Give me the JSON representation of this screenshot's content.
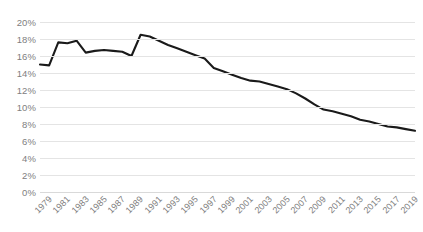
{
  "chart_data": {
    "type": "line",
    "title": "",
    "subtitle": "",
    "xlabel": "",
    "ylabel": "",
    "grid": true,
    "legend": false,
    "legend_position": "none",
    "line_color": "#1a1a1a",
    "gridline_color": "#e4e4e4",
    "axis_label_color": "#808080",
    "ylim": [
      0,
      20
    ],
    "y_ticks": [
      0,
      2,
      4,
      6,
      8,
      10,
      12,
      14,
      16,
      18,
      20
    ],
    "y_tick_labels": [
      "0%",
      "2%",
      "4%",
      "6%",
      "8%",
      "10%",
      "12%",
      "14%",
      "16%",
      "18%",
      "20%"
    ],
    "xlim": [
      1979,
      2020
    ],
    "x_tick_labels": [
      "1979",
      "1981",
      "1983",
      "1985",
      "1987",
      "1989",
      "1991",
      "1993",
      "1995",
      "1997",
      "1999",
      "2001",
      "2003",
      "2005",
      "2007",
      "2009",
      "2011",
      "2013",
      "2015",
      "2017",
      "2019"
    ],
    "x": [
      1979,
      1980,
      1981,
      1982,
      1983,
      1984,
      1985,
      1986,
      1987,
      1988,
      1989,
      1990,
      1991,
      1992,
      1993,
      1994,
      1995,
      1996,
      1997,
      1998,
      1999,
      2000,
      2001,
      2002,
      2003,
      2004,
      2005,
      2006,
      2007,
      2008,
      2009,
      2010,
      2011,
      2012,
      2013,
      2014,
      2015,
      2016,
      2017,
      2018,
      2019,
      2020
    ],
    "values": [
      15.0,
      14.9,
      17.6,
      17.5,
      17.8,
      16.4,
      16.6,
      16.7,
      16.6,
      16.5,
      16.0,
      18.5,
      18.3,
      17.8,
      17.3,
      16.9,
      16.5,
      16.1,
      15.7,
      14.6,
      14.2,
      13.8,
      13.4,
      13.1,
      13.0,
      12.7,
      12.4,
      12.1,
      11.6,
      11.0,
      10.3,
      9.7,
      9.5,
      9.2,
      8.9,
      8.5,
      8.3,
      8.0,
      7.7,
      7.6,
      7.4,
      7.2
    ]
  }
}
